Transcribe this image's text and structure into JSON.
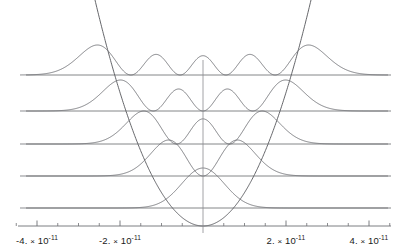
{
  "chart_data": {
    "type": "line",
    "title": "",
    "subtitle": "",
    "xlabel": "",
    "ylabel": "",
    "grid": false,
    "legend": "none",
    "xlim": [
      -4.8e-11,
      4.8e-11
    ],
    "x_major_ticks": [
      -4e-11,
      -2e-11,
      2e-11,
      4e-11
    ],
    "x_minor_tick_count_between_majors": 3,
    "x_tick_labels": [
      {
        "value": -4e-11,
        "mantissa": "-4.",
        "times": "×",
        "base": "10",
        "exponent": "-11"
      },
      {
        "value": -2e-11,
        "mantissa": "-2.",
        "times": "×",
        "base": "10",
        "exponent": "-11"
      },
      {
        "value": 2e-11,
        "mantissa": "2.",
        "times": "×",
        "base": "10",
        "exponent": "-11"
      },
      {
        "value": 4e-11,
        "mantissa": "4.",
        "times": "×",
        "base": "10",
        "exponent": "-11"
      }
    ],
    "potential": {
      "name": "harmonic-potential-parabola",
      "shape": "parabola",
      "vertex_x": 0,
      "color": "#55565a"
    },
    "axis_color": "#6e7074",
    "energy_level_color": "#76787c",
    "wavefunction_color": "#6a6c70",
    "series": [
      {
        "name": "n=0",
        "quantum_number": 0,
        "nodes": 0,
        "peaks": 1,
        "level_y_px": 208,
        "amplitude_px": 40,
        "width_px": 58
      },
      {
        "name": "n=1",
        "quantum_number": 1,
        "nodes": 1,
        "peaks": 2,
        "level_y_px": 176,
        "amplitude_px": 38,
        "width_px": 66
      },
      {
        "name": "n=2",
        "quantum_number": 2,
        "nodes": 2,
        "peaks": 3,
        "level_y_px": 144,
        "amplitude_px": 34,
        "width_px": 72
      },
      {
        "name": "n=3",
        "quantum_number": 3,
        "nodes": 3,
        "peaks": 4,
        "level_y_px": 111,
        "amplitude_px": 32,
        "width_px": 78
      },
      {
        "name": "n=4",
        "quantum_number": 4,
        "nodes": 4,
        "peaks": 5,
        "level_y_px": 75,
        "amplitude_px": 0,
        "width_px": 84
      }
    ],
    "axis_y_px": 226,
    "origin_x_px": 203,
    "px_per_1e_minus_11": 41.5
  },
  "axis": {
    "name": "x-axis",
    "horizontal_line": true,
    "vertical_line": true
  }
}
